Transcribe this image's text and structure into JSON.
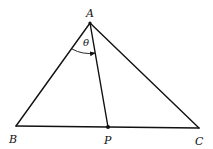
{
  "diagram": {
    "type": "geometry-triangle",
    "points": {
      "A": {
        "label": "A",
        "x": 90,
        "y": 23
      },
      "B": {
        "label": "B",
        "x": 16,
        "y": 126
      },
      "C": {
        "label": "C",
        "x": 199,
        "y": 128
      },
      "P": {
        "label": "P",
        "x": 108,
        "y": 127
      }
    },
    "segments": [
      "AB",
      "AC",
      "BC",
      "AP"
    ],
    "angle": {
      "label": "θ",
      "vertex": "A",
      "from": "AB",
      "to": "AP",
      "arrow": true
    },
    "marked_points": [
      "A",
      "P"
    ],
    "colors": {
      "stroke": "#111111",
      "background": "#ffffff"
    }
  }
}
